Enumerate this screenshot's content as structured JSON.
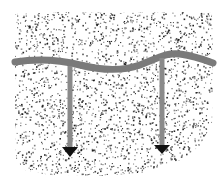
{
  "diagram": {
    "width": 222,
    "height": 184,
    "background": "#ffffff",
    "region": {
      "name": "stippled-soil-region",
      "outline": [
        [
          15,
          14
        ],
        [
          60,
          12
        ],
        [
          120,
          13
        ],
        [
          170,
          12
        ],
        [
          212,
          13
        ],
        [
          213,
          60
        ],
        [
          212,
          125
        ],
        [
          200,
          145
        ],
        [
          185,
          158
        ],
        [
          150,
          172
        ],
        [
          100,
          176
        ],
        [
          50,
          175
        ],
        [
          25,
          170
        ],
        [
          16,
          160
        ],
        [
          15,
          100
        ]
      ],
      "dot_color": "#1a1a1a",
      "dot_count": 2600,
      "seed": 7
    },
    "band": {
      "name": "wavy-layer-band",
      "path": "M15,62 C40,58 60,60 80,65 C100,70 120,72 140,65 C158,58 168,52 180,54 C195,56 205,60 213,63",
      "color": "#7a7a7a",
      "width": 7
    },
    "arrows": [
      {
        "name": "left-downward-arrow",
        "x": 70,
        "y_start": 66,
        "y_end": 147,
        "head_height": 10,
        "head_half_width": 8,
        "shaft_color": "#8a8a8a",
        "head_color": "#111111",
        "shaft_width": 5
      },
      {
        "name": "right-downward-arrow",
        "x": 162,
        "y_start": 58,
        "y_end": 145,
        "head_height": 9,
        "head_half_width": 8,
        "shaft_color": "#8a8a8a",
        "head_color": "#111111",
        "shaft_width": 5
      }
    ]
  }
}
